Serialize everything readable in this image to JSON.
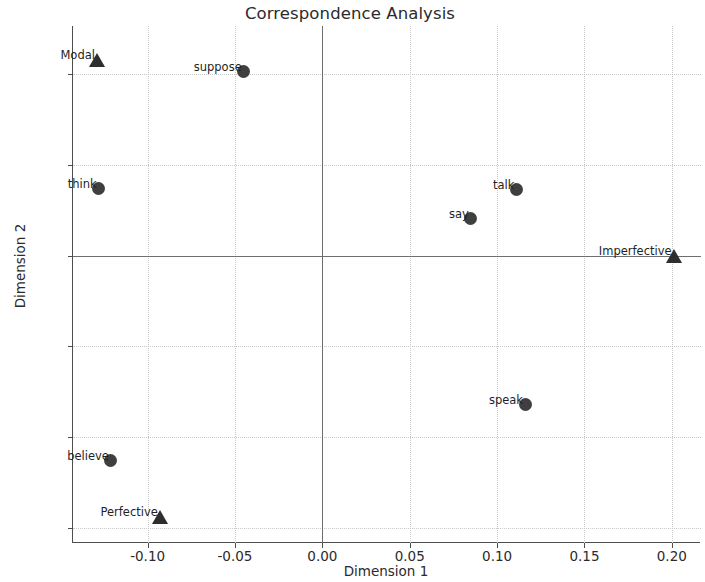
{
  "chart_data": {
    "type": "scatter",
    "title": "Correspondence Analysis",
    "xlabel": "Dimension 1",
    "ylabel": "Dimension 2",
    "xlim": [
      -0.1427,
      0.2167
    ],
    "ylim": [
      -0.0633,
      0.0506
    ],
    "xticks": [
      -0.1,
      -0.05,
      0.0,
      0.05,
      0.1,
      0.15,
      0.2
    ],
    "xticklabels": [
      "-0.10",
      "-0.05",
      "0.00",
      "0.05",
      "0.10",
      "0.15",
      "0.20"
    ],
    "yticks": [
      0.04,
      0.02,
      0.0,
      -0.02,
      -0.04,
      -0.06
    ],
    "yticklabels": [
      "0.04",
      "0.02",
      "0.00",
      "-0.02",
      "-0.04",
      "-0.06"
    ],
    "grid": true,
    "grid_style": "dotted",
    "zero_lines": true,
    "legend": null,
    "series": [
      {
        "name": "rows",
        "marker": "circle",
        "color": "#3f3f3f",
        "points": [
          {
            "label": "suppose",
            "x": -0.045,
            "y": 0.0405
          },
          {
            "label": "think",
            "x": -0.128,
            "y": 0.0148
          },
          {
            "label": "say",
            "x": 0.085,
            "y": 0.0082
          },
          {
            "label": "talk",
            "x": 0.111,
            "y": 0.0145
          },
          {
            "label": "speak",
            "x": 0.116,
            "y": -0.0327
          },
          {
            "label": "believe",
            "x": -0.121,
            "y": -0.0452
          }
        ]
      },
      {
        "name": "columns",
        "marker": "triangle",
        "color": "#2e2e2e",
        "points": [
          {
            "label": "Modal",
            "x": -0.129,
            "y": 0.0432
          },
          {
            "label": "Imperfective",
            "x": 0.201,
            "y": 0.0
          },
          {
            "label": "Perfective",
            "x": -0.093,
            "y": -0.0575
          }
        ]
      }
    ]
  },
  "colors": {
    "axis": "#4d4d4d",
    "grid": "#c9c9c9",
    "zero_line": "#6e6e6e",
    "marker_circle": "#3f3f3f",
    "marker_triangle": "#2e2e2e",
    "text": "#2b2b2b",
    "background": "#ffffff"
  }
}
